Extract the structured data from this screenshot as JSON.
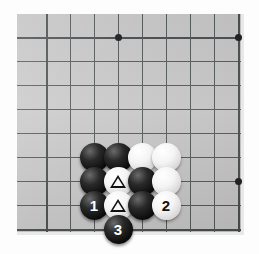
{
  "diagram": {
    "type": "go-board-diagram",
    "board_color": "#c9c9c9",
    "line_color": "#555a5d",
    "background_color": "#fdfdfd",
    "grid": {
      "spacing_px": 24,
      "origin_x_px": 29,
      "origin_y_px": 23,
      "columns": 9,
      "rows": 9
    },
    "star_points": [
      {
        "name": "star-point-top-left",
        "col": 3,
        "row": 0
      },
      {
        "name": "star-point-top-right",
        "col": 8,
        "row": 0
      },
      {
        "name": "star-point-right",
        "col": 8,
        "row": 6
      }
    ],
    "stones": [
      {
        "id": "stone-black-a",
        "color": "black",
        "label": "",
        "mark": "",
        "col": 2,
        "row": 5
      },
      {
        "id": "stone-black-b",
        "color": "black",
        "label": "",
        "mark": "",
        "col": 3,
        "row": 5
      },
      {
        "id": "stone-white-a",
        "color": "white",
        "label": "",
        "mark": "",
        "col": 4,
        "row": 5
      },
      {
        "id": "stone-white-b",
        "color": "white",
        "label": "",
        "mark": "",
        "col": 5,
        "row": 5
      },
      {
        "id": "stone-black-c",
        "color": "black",
        "label": "",
        "mark": "",
        "col": 2,
        "row": 6
      },
      {
        "id": "stone-white-triangle-upper",
        "color": "white",
        "label": "",
        "mark": "triangle",
        "col": 3,
        "row": 6
      },
      {
        "id": "stone-black-d",
        "color": "black",
        "label": "",
        "mark": "",
        "col": 4,
        "row": 6
      },
      {
        "id": "stone-white-c",
        "color": "white",
        "label": "",
        "mark": "",
        "col": 5,
        "row": 6
      },
      {
        "id": "stone-move-1",
        "color": "black",
        "label": "1",
        "mark": "",
        "col": 2,
        "row": 7
      },
      {
        "id": "stone-white-triangle-lower",
        "color": "white",
        "label": "",
        "mark": "triangle",
        "col": 3,
        "row": 7
      },
      {
        "id": "stone-black-e",
        "color": "black",
        "label": "",
        "mark": "",
        "col": 4,
        "row": 7
      },
      {
        "id": "stone-move-2",
        "color": "white",
        "label": "2",
        "mark": "",
        "col": 5,
        "row": 7
      },
      {
        "id": "stone-move-3",
        "color": "black",
        "label": "3",
        "mark": "",
        "col": 3,
        "row": 8
      }
    ],
    "move_sequence": [
      {
        "number": "1",
        "color": "black"
      },
      {
        "number": "2",
        "color": "white"
      },
      {
        "number": "3",
        "color": "black"
      }
    ]
  }
}
